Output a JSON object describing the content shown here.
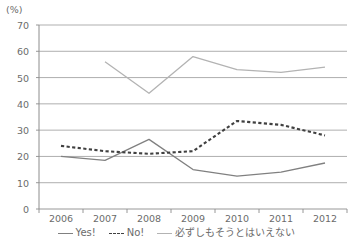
{
  "chart_data": {
    "type": "line",
    "title": "",
    "xlabel": "",
    "ylabel": "(%)",
    "unit_label": "(%)",
    "categories": [
      "2006",
      "2007",
      "2008",
      "2009",
      "2010",
      "2011",
      "2012"
    ],
    "ylim": [
      0,
      70
    ],
    "ytick_labels": [
      "0",
      "10",
      "20",
      "30",
      "40",
      "50",
      "60",
      "70"
    ],
    "ytick_values": [
      0,
      10,
      20,
      30,
      40,
      50,
      60,
      70
    ],
    "grid": "horizontal",
    "legend_position": "bottom",
    "series": [
      {
        "name": "Yes!",
        "style": "solid",
        "color": "#808080",
        "x": [
          "2006",
          "2007",
          "2008",
          "2009",
          "2010",
          "2011",
          "2012"
        ],
        "values": [
          20,
          18.5,
          26.5,
          15,
          12.5,
          14,
          17.5
        ]
      },
      {
        "name": "No!",
        "style": "dashed",
        "color": "#404040",
        "x": [
          "2006",
          "2007",
          "2008",
          "2009",
          "2010",
          "2011",
          "2012"
        ],
        "values": [
          24,
          22,
          21,
          22,
          33.5,
          32,
          28
        ]
      },
      {
        "name": "必ずしもそうとはいえない",
        "style": "solid",
        "color": "#b3b3b3",
        "x": [
          "2007",
          "2008",
          "2009",
          "2010",
          "2011",
          "2012"
        ],
        "values": [
          56,
          44,
          58,
          53,
          52,
          54
        ]
      }
    ]
  },
  "legend": {
    "items": [
      {
        "label": "Yes!",
        "style": "solid",
        "color": "#808080"
      },
      {
        "label": "No!",
        "style": "dashed",
        "color": "#404040"
      },
      {
        "label": "必ずしもそうとはいえない",
        "style": "solid",
        "color": "#b3b3b3"
      }
    ]
  }
}
